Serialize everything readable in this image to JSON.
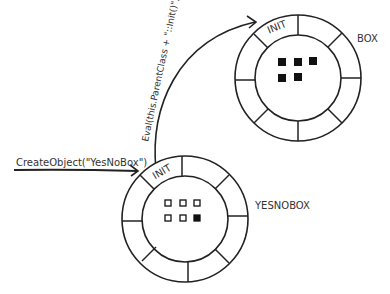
{
  "diagram": {
    "entry_call": "CreateObject(\"YesNoBox\")",
    "parent_call": "Eval(this.ParentClass + \"::Init()\")",
    "objects": [
      {
        "name": "BOX",
        "init_label": "INIT",
        "squares": [
          "filled",
          "filled",
          "filled",
          "filled",
          "filled"
        ]
      },
      {
        "name": "YESNOBOX",
        "init_label": "INIT",
        "squares": [
          "empty",
          "empty",
          "empty",
          "empty",
          "empty",
          "filled"
        ]
      }
    ],
    "colors": {
      "stroke": "#222222",
      "text": "#333333",
      "background": "#ffffff"
    }
  }
}
